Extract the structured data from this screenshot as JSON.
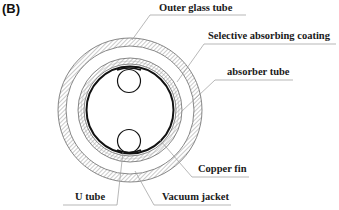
{
  "figure": {
    "panel_label": "(B)"
  },
  "labels": [
    {
      "id": "outer-glass-tube",
      "text": "Outer  glass tube",
      "x": 159,
      "y": 5
    },
    {
      "id": "selective-absorbing-coating",
      "text": "Selective absorbing coating",
      "x": 208,
      "y": 29
    },
    {
      "id": "absorber-tube",
      "text": "absorber tube",
      "x": 227,
      "y": 66
    },
    {
      "id": "copper-fin",
      "text": "Copper fin",
      "x": 198,
      "y": 163
    },
    {
      "id": "u-tube",
      "text": "U tube",
      "x": 75,
      "y": 191
    },
    {
      "id": "vacuum-jacket",
      "text": "Vacuum jacket",
      "x": 162,
      "y": 191
    }
  ],
  "geometry": {
    "center": [
      130,
      110
    ],
    "outer_glass_outer_r": 72,
    "outer_glass_inner_r": 64,
    "absorber_outer_r": 52,
    "absorber_inner_r": 46,
    "copper_fin_r": 43,
    "u_tube_r": 12,
    "u_tube_top_center": [
      129,
      81
    ],
    "u_tube_bottom_center": [
      129,
      140
    ]
  },
  "colors": {
    "line": "#1a1a1a",
    "hatch": "#8a8a8a",
    "leader": "#9a9a9a"
  }
}
